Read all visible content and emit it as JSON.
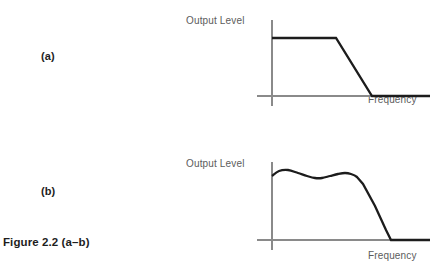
{
  "figure": {
    "caption": "Figure 2.2 (a–b)",
    "background_color": "#ffffff",
    "axis_color": "#8a8a8a",
    "curve_color": "#1c1c1c",
    "label_color": "#5c5c5c",
    "caption_color": "#1d1d1d"
  },
  "panels": [
    {
      "letter": "(a)",
      "ylabel": "Output Level",
      "xlabel": "Frequency"
    },
    {
      "letter": "(b)",
      "ylabel": "Output Level",
      "xlabel": "Frequency"
    }
  ],
  "chart_data": [
    {
      "type": "line",
      "title": "(a)",
      "xlabel": "Frequency",
      "ylabel": "Output Level",
      "xlim": [
        0,
        175
      ],
      "ylim": [
        0,
        80
      ],
      "grid": false,
      "legend": "none",
      "annotation": "Ideal low-pass filter response: flat passband, then a straight-line roll-off to zero output.",
      "series": [
        {
          "name": "Ideal response",
          "points": [
            [
              17,
              60
            ],
            [
              81,
              60
            ],
            [
              117,
              2
            ],
            [
              175,
              2
            ]
          ]
        }
      ],
      "axes": {
        "y_axis": [
          [
            17,
            78
          ],
          [
            17,
            -8
          ]
        ],
        "x_axis": [
          [
            2,
            2
          ],
          [
            175,
            2
          ]
        ]
      }
    },
    {
      "type": "line",
      "title": "(b)",
      "xlabel": "Frequency",
      "ylabel": "Output Level",
      "xlim": [
        0,
        175
      ],
      "ylim": [
        0,
        80
      ],
      "grid": false,
      "legend": "none",
      "annotation": "Real-world filter response: passband shows ripple, followed by a steeper roll-off to zero output.",
      "series": [
        {
          "name": "Actual response",
          "points": [
            [
              17,
              66
            ],
            [
              24,
              71
            ],
            [
              33,
              72
            ],
            [
              43,
              69
            ],
            [
              52,
              66
            ],
            [
              60,
              64
            ],
            [
              67,
              64
            ],
            [
              75,
              66
            ],
            [
              83,
              68
            ],
            [
              90,
              69
            ],
            [
              96,
              68
            ],
            [
              102,
              65
            ],
            [
              108,
              58
            ],
            [
              120,
              36
            ],
            [
              131,
              12
            ],
            [
              136,
              2
            ],
            [
              175,
              2
            ]
          ]
        }
      ],
      "axes": {
        "y_axis": [
          [
            17,
            80
          ],
          [
            17,
            -8
          ]
        ],
        "x_axis": [
          [
            2,
            2
          ],
          [
            175,
            2
          ]
        ]
      }
    }
  ]
}
